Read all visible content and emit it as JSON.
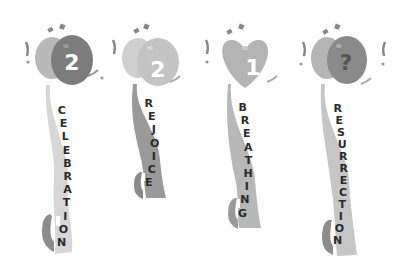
{
  "items": [
    {
      "number": "2",
      "word": "CELEBRATION",
      "balloon_back": "#b9b9b9",
      "balloon_front": "#7c7c7c",
      "ribbon": "#d7d7d7"
    },
    {
      "number": "2",
      "word": "REJOICE",
      "balloon_back": "#cfcfcf",
      "balloon_front": "#c4c4c4",
      "ribbon": "#9a9a9a"
    },
    {
      "number": "1",
      "word": "BREATHING",
      "balloon_back": "#b4b4b4",
      "balloon_front": "#b4b4b4",
      "ribbon": "#b8b8b8"
    },
    {
      "number": "?",
      "word": "RESURRECTION",
      "balloon_back": "#b5b5b5",
      "balloon_front": "#8a8a8a",
      "ribbon": "#c6c6c6"
    }
  ]
}
